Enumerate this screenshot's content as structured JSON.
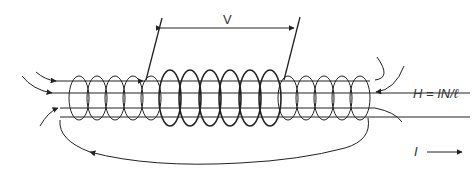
{
  "diagram": {
    "labels": {
      "voltage": "V",
      "field_equation": "H = IN/ℓ",
      "current": "I"
    },
    "stroke_color": "#222222"
  }
}
